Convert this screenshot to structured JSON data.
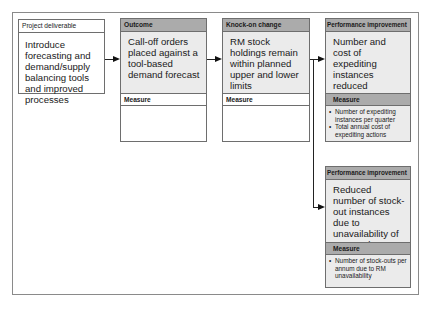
{
  "diagram": {
    "project_deliverable": {
      "header": "Project deliverable",
      "text": "Introduce forecasting and demand/supply balancing tools and improved processes"
    },
    "outcome": {
      "header": "Outcome",
      "text": "Call-off orders placed against a tool-based demand forecast",
      "measure_header": "Measure",
      "measures": []
    },
    "knock_on_change": {
      "header": "Knock-on change",
      "text": "RM stock holdings remain within planned upper and lower limits",
      "measure_header": "Measure",
      "measures": []
    },
    "performance_improvement_1": {
      "header": "Performance improvement",
      "text": "Number and cost of expediting instances reduced",
      "measure_header": "Measure",
      "measures": [
        "Number of expediting instances per quarter",
        "Total annual cost of expediting actions"
      ]
    },
    "performance_improvement_2": {
      "header": "Performance improvement",
      "text": "Reduced number of stock-out instances due to unavailability of RM stocks",
      "measure_header": "Measure",
      "measures": [
        "Number of stock-outs per annum due to RM unavailability"
      ]
    },
    "connections": [
      {
        "from": "project_deliverable",
        "to": "outcome"
      },
      {
        "from": "outcome",
        "to": "knock_on_change"
      },
      {
        "from": "knock_on_change",
        "to": "performance_improvement_1"
      },
      {
        "from": "knock_on_change",
        "to": "performance_improvement_2"
      }
    ],
    "colors": {
      "header_fill": "#ababab",
      "body_fill": "#ebebeb",
      "border": "#6e6e6e"
    }
  }
}
